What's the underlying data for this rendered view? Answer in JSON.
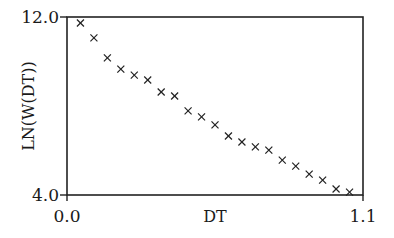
{
  "chart_data": {
    "type": "scatter",
    "title": "",
    "xlabel": "DT",
    "ylabel": "LN(W(DT))",
    "xlim": [
      0.0,
      1.1
    ],
    "ylim": [
      4.0,
      12.0
    ],
    "x_ticks": [
      "0.0",
      "1.1"
    ],
    "y_ticks": [
      "4.0",
      "12.0"
    ],
    "grid": false,
    "legend": null,
    "marker": "x",
    "series": [
      {
        "name": "LN(W(DT))",
        "x": [
          0.05,
          0.1,
          0.15,
          0.2,
          0.25,
          0.3,
          0.35,
          0.4,
          0.45,
          0.5,
          0.55,
          0.6,
          0.65,
          0.7,
          0.75,
          0.8,
          0.85,
          0.9,
          0.95,
          1.0,
          1.05
        ],
        "y": [
          11.73,
          11.06,
          10.16,
          9.66,
          9.39,
          9.17,
          8.63,
          8.45,
          7.78,
          7.51,
          7.15,
          6.65,
          6.38,
          6.16,
          6.02,
          5.57,
          5.3,
          4.94,
          4.67,
          4.27,
          4.13
        ]
      }
    ]
  }
}
